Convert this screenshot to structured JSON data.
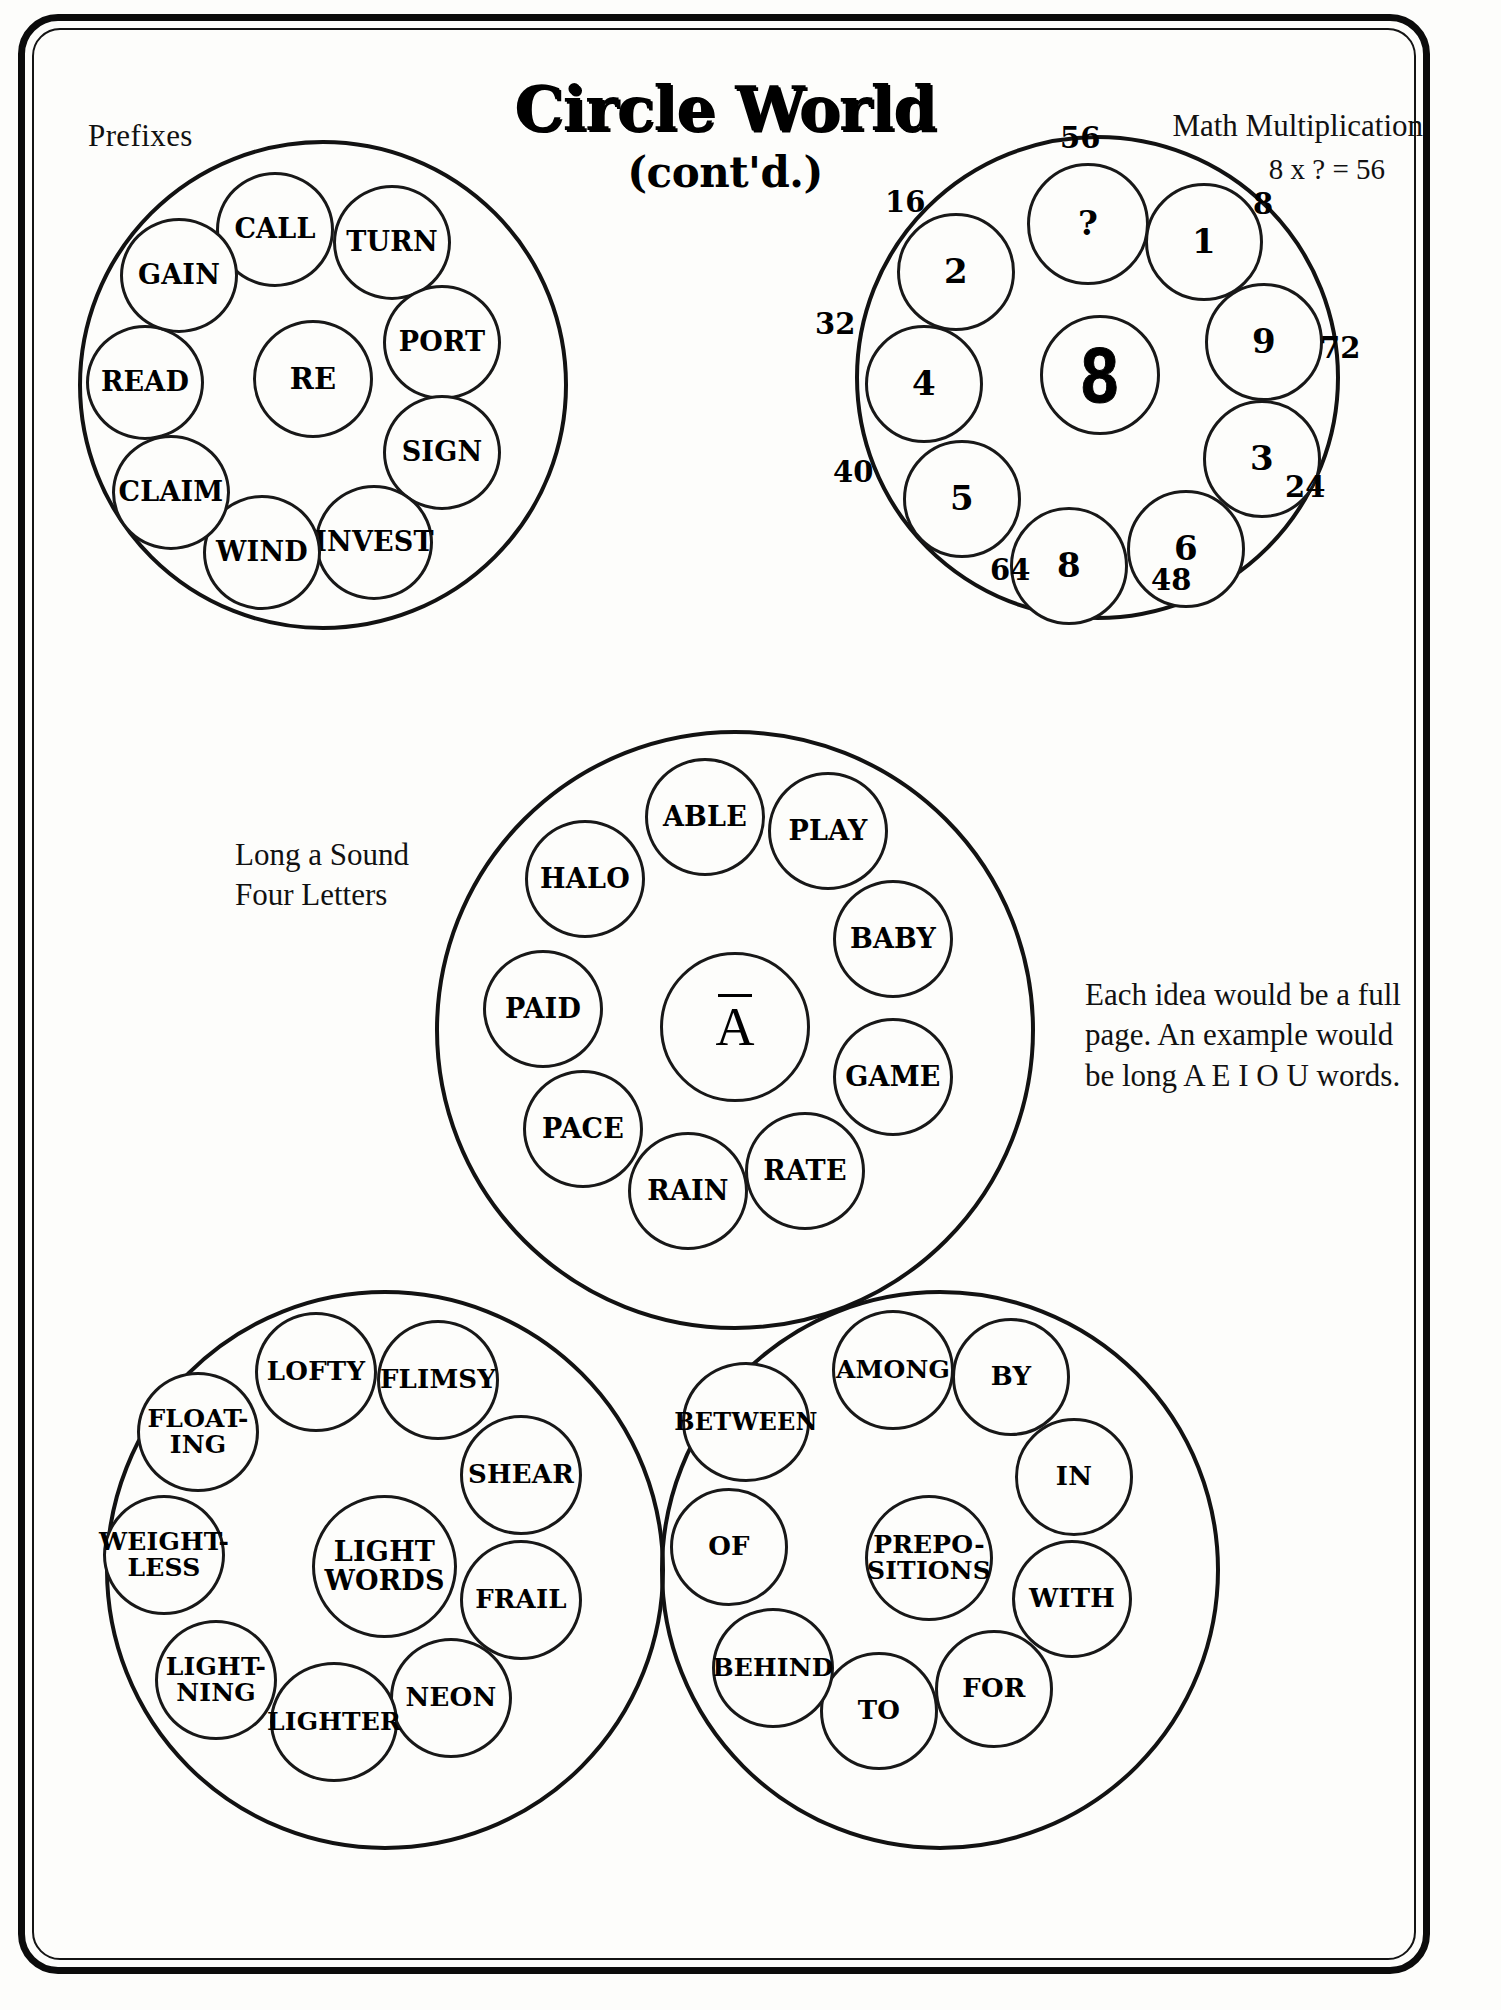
{
  "page": {
    "title": "Circle World",
    "subtitle": "(cont'd.)",
    "header_left": "Prefixes",
    "header_right_title": "Math Multiplication",
    "header_right_equation": "8 x ? = 56"
  },
  "captions": {
    "long_a_line1": "Long a Sound",
    "long_a_line2": "Four Letters",
    "note": "Each idea would be a full page. An example would be long A E I O U words."
  },
  "clusters": [
    {
      "id": "prefixes",
      "name": "Prefixes",
      "center": "RE",
      "nodes": [
        "CALL",
        "TURN",
        "PORT",
        "SIGN",
        "INVEST",
        "WIND",
        "CLAIM",
        "READ",
        "GAIN"
      ]
    },
    {
      "id": "math-multiplication",
      "name": "Math Multiplication",
      "center": "8",
      "nodes": [
        "?",
        "1",
        "9",
        "3",
        "6",
        "8",
        "5",
        "4",
        "2"
      ],
      "outer_labels": [
        "56",
        "8",
        "72",
        "24",
        "48",
        "64",
        "40",
        "32",
        "16"
      ]
    },
    {
      "id": "long-a-sound",
      "name": "Long a Sound Four Letters",
      "center": "A",
      "nodes": [
        "ABLE",
        "PLAY",
        "BABY",
        "GAME",
        "RATE",
        "RAIN",
        "PACE",
        "PAID",
        "HALO"
      ]
    },
    {
      "id": "light-words",
      "name": "Light Words",
      "center": "LIGHT WORDS",
      "center_line1": "LIGHT",
      "center_line2": "WORDS",
      "nodes": [
        "LOFTY",
        "FLIMSY",
        "SHEAR",
        "FRAIL",
        "NEON",
        "LIGHTER",
        "LIGHT-NING",
        "WEIGHT-LESS",
        "FLOAT-ING"
      ]
    },
    {
      "id": "prepositions",
      "name": "Prepositions",
      "center": "PREPO-SITIONS",
      "center_line1": "PREPO-",
      "center_line2": "SITIONS",
      "nodes": [
        "AMONG",
        "BY",
        "IN",
        "WITH",
        "FOR",
        "TO",
        "BEHIND",
        "OF",
        "BETWEEN"
      ]
    }
  ]
}
